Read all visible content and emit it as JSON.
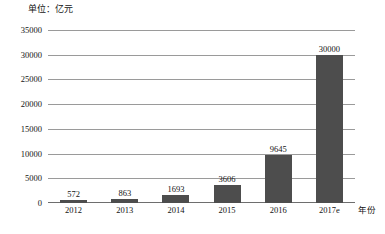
{
  "chart_data": {
    "type": "bar",
    "title": "",
    "unit_caption": "单位：亿元",
    "categories": [
      "2012",
      "2013",
      "2014",
      "2015",
      "2016",
      "2017e"
    ],
    "values": [
      572,
      863,
      1693,
      3606,
      9645,
      30000
    ],
    "value_labels": [
      "572",
      "863",
      "1693",
      "3606",
      "9645",
      "30000"
    ],
    "xlabel": "年份",
    "ylabel": "",
    "ylim": [
      0,
      35000
    ],
    "ytick_step": 5000,
    "yticks": [
      35000,
      30000,
      25000,
      20000,
      15000,
      10000,
      5000,
      0
    ],
    "ytick_labels": [
      "35000",
      "30000",
      "25000",
      "20000",
      "15000",
      "10000",
      "5000",
      "0"
    ],
    "grid": true,
    "legend": false,
    "bar_color": "#4d4d4d",
    "gridline_color": "#9a9a9a",
    "background_color": "#ffffff"
  }
}
